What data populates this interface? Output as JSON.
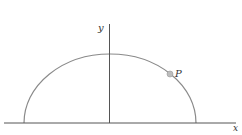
{
  "diagram": {
    "axes": {
      "x_label": "x",
      "y_label": "y"
    },
    "curve": {
      "type": "upper-half-ellipse",
      "color": "#888888"
    },
    "point": {
      "label": "P",
      "color": "#bdbdbd"
    },
    "colors": {
      "axis": "#555555",
      "background": "#ffffff"
    }
  }
}
